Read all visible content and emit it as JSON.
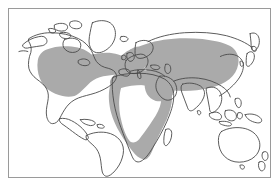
{
  "figure": {
    "type": "world-distribution-map",
    "title": "",
    "projection": "equirectangular",
    "background_color": "#ffffff",
    "frame_color": "#9a9a9a",
    "coastline_color": "#4a4a4a",
    "shade_color": "#aaaaaa",
    "unshaded_color": "#ffffff",
    "legend": {
      "visible": false,
      "entries": [
        {
          "label": "Distribution range",
          "color": "#aaaaaa"
        },
        {
          "label": "Outside range",
          "color": "#ffffff"
        }
      ]
    }
  },
  "map": {
    "shaded_regions": [
      {
        "name": "north-america-range",
        "label": "Contiguous United States and southern Canada"
      },
      {
        "name": "europe-range",
        "label": "Europe including British Isles and Scandinavia"
      },
      {
        "name": "northern-eurasia-range",
        "label": "Russia and Central Asia eastward to the Pacific margin"
      },
      {
        "name": "north-africa-range",
        "label": "Mediterranean North African coastal strip"
      },
      {
        "name": "middle-east-range",
        "label": "Arabian Peninsula and Middle East"
      },
      {
        "name": "sub-saharan-africa-range",
        "label": "Sub-Saharan Africa periphery and southern Africa"
      }
    ],
    "unshaded_regions": [
      {
        "name": "arctic-canada",
        "label": "Canadian Arctic Archipelago and Greenland"
      },
      {
        "name": "alaska",
        "label": "Alaska"
      },
      {
        "name": "central-america",
        "label": "Central America and Caribbean"
      },
      {
        "name": "south-america",
        "label": "South America"
      },
      {
        "name": "sahara-interior",
        "label": "Sahara interior"
      },
      {
        "name": "congo-basin",
        "label": "Congo Basin interior"
      },
      {
        "name": "india-subcontinent",
        "label": "Indian subcontinent"
      },
      {
        "name": "southeast-asia",
        "label": "Southeast Asia, Indonesia and the Philippines"
      },
      {
        "name": "japan-korea",
        "label": "Japan and the Korean Peninsula"
      },
      {
        "name": "australia",
        "label": "Australia"
      },
      {
        "name": "new-zealand",
        "label": "New Zealand"
      },
      {
        "name": "madagascar",
        "label": "Madagascar"
      }
    ]
  }
}
